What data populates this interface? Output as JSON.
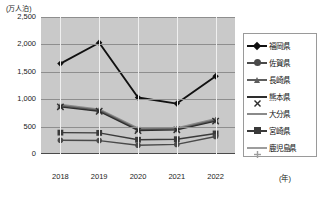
{
  "chart_data": {
    "type": "line",
    "title": "",
    "xlabel": "(年)",
    "ylabel": "(万人泊)",
    "x": [
      "2018",
      "2019",
      "2020",
      "2021",
      "2022"
    ],
    "ylim": [
      0,
      2500
    ],
    "yticks": [
      "0",
      "500",
      "1,000",
      "1,500",
      "2,000",
      "2,500"
    ],
    "grid": true,
    "legend_position": "right",
    "series": [
      {
        "name": "福岡県",
        "marker": "diamond",
        "color": "#111111",
        "values": [
          1650,
          2030,
          1030,
          920,
          1420
        ]
      },
      {
        "name": "佐賀県",
        "marker": "circle",
        "color": "#4a4a4a",
        "values": [
          250,
          245,
          160,
          175,
          320
        ]
      },
      {
        "name": "長崎県",
        "marker": "triangle",
        "color": "#5e5e5e",
        "values": [
          880,
          800,
          450,
          455,
          620
        ]
      },
      {
        "name": "熊本県",
        "marker": "x",
        "color": "#2e2e2e",
        "values": [
          860,
          780,
          430,
          440,
          600
        ]
      },
      {
        "name": "大分県",
        "marker": "none",
        "color": "#8a8a8a",
        "values": [
          900,
          815,
          470,
          470,
          640
        ]
      },
      {
        "name": "宮崎県",
        "marker": "square",
        "color": "#3a3a3a",
        "values": [
          390,
          385,
          260,
          270,
          375
        ]
      },
      {
        "name": "鹿児島県",
        "marker": "plus",
        "color": "#9d9d9d",
        "values": [
          870,
          790,
          445,
          445,
          610
        ]
      }
    ]
  },
  "axes": {
    "y_unit_label": "(万人泊)",
    "x_unit_label": "(年)"
  }
}
